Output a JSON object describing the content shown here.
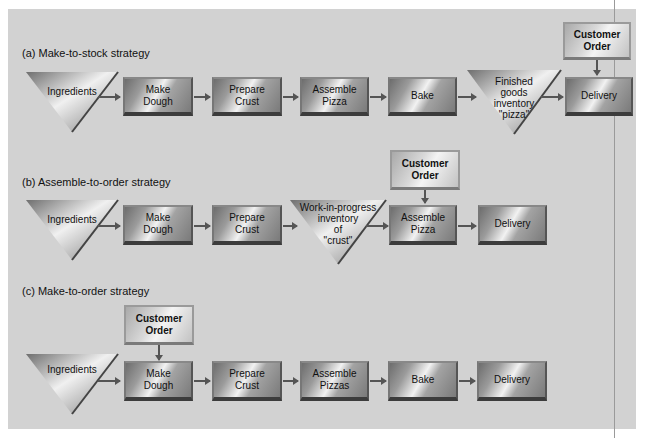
{
  "sections": {
    "a": {
      "title": "(a) Make-to-stock strategy",
      "ingredients": "Ingredients",
      "steps": [
        "Make\nDough",
        "Prepare\nCrust",
        "Assemble\nPizza",
        "Bake"
      ],
      "inventory": "Finished\ngoods\ninventory\n\"pizza\"",
      "final": "Delivery",
      "customer_order": "Customer\nOrder"
    },
    "b": {
      "title": "(b) Assemble-to-order strategy",
      "ingredients": "Ingredients",
      "steps": [
        "Make\nDough",
        "Prepare\nCrust"
      ],
      "inventory": "Work-in-progress\ninventory\nof\n\"crust\"",
      "assemble": "Assemble\nPizza",
      "final": "Delivery",
      "customer_order": "Customer\nOrder"
    },
    "c": {
      "title": "(c) Make-to-order strategy",
      "ingredients": "Ingredients",
      "steps": [
        "Make\nDough",
        "Prepare\nCrust",
        "Assemble\nPizzas",
        "Bake"
      ],
      "final": "Delivery",
      "customer_order": "Customer\nOrder"
    }
  },
  "colors": {
    "panel_bg": "#d2d2d2",
    "arrow": "#555555",
    "text": "#111111"
  }
}
